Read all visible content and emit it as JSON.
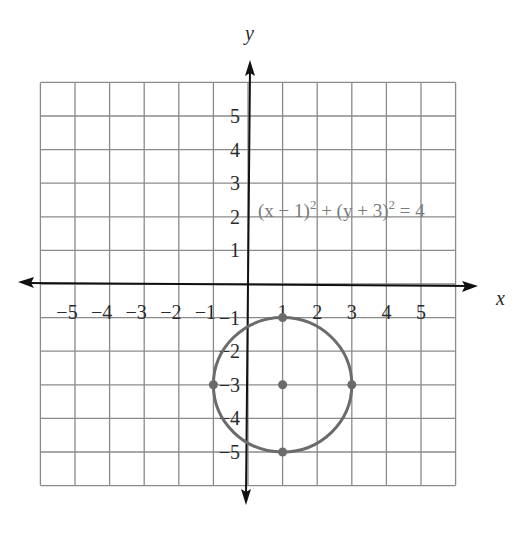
{
  "chart_data": {
    "type": "scatter",
    "title": "",
    "xlabel": "x",
    "ylabel": "y",
    "xlim": [
      -6,
      6
    ],
    "ylim": [
      -6,
      6
    ],
    "grid": true,
    "x_tick_labels": [
      "−5",
      "−4",
      "−3",
      "−2",
      "−1",
      "1",
      "2",
      "3",
      "4",
      "5"
    ],
    "x_ticks": [
      -5,
      -4,
      -3,
      -2,
      -1,
      1,
      2,
      3,
      4,
      5
    ],
    "y_tick_labels": [
      "5",
      "4",
      "3",
      "2",
      "1",
      "−1",
      "−2",
      "−3",
      "−4",
      "−5"
    ],
    "y_ticks": [
      5,
      4,
      3,
      2,
      1,
      -1,
      -2,
      -3,
      -4,
      -5
    ],
    "annotations": [
      {
        "text": "(x − 1)² + (y + 3)² = 4",
        "x": 0.3,
        "y": 2.5
      }
    ],
    "series": [
      {
        "name": "circle",
        "kind": "curve",
        "center": [
          1,
          -3
        ],
        "radius": 2,
        "equation": "(x − 1)² + (y + 3)² = 4"
      },
      {
        "name": "points",
        "kind": "points",
        "points": [
          {
            "x": 1,
            "y": -3,
            "label": "center"
          },
          {
            "x": 1,
            "y": -1
          },
          {
            "x": 3,
            "y": -3
          },
          {
            "x": 1,
            "y": -5
          },
          {
            "x": -1,
            "y": -3
          }
        ]
      }
    ]
  },
  "labels": {
    "x_axis": "x",
    "y_axis": "y",
    "equation_main": "(x − 1)",
    "equation_sup1": "2",
    "equation_mid": " + (y + 3)",
    "equation_sup2": "2",
    "equation_end": " = 4"
  },
  "colors": {
    "grid": "#8a8a8a",
    "axis": "#111111",
    "curve": "#6b6b6b",
    "equation": "#7a7a7a"
  }
}
